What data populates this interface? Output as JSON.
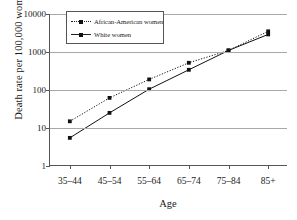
{
  "chart_data": {
    "type": "line",
    "title": "",
    "xlabel": "Age",
    "ylabel": "Death rate per 100,000 women",
    "categories": [
      "35–44",
      "45–54",
      "55–64",
      "65–74",
      "75–84",
      "85+"
    ],
    "yticks": [
      1,
      10,
      100,
      1000,
      10000
    ],
    "ytick_labels": [
      "1",
      "10",
      "100",
      "1000",
      "10000"
    ],
    "yscale": "log",
    "ylim": [
      1,
      10000
    ],
    "grid": "horizontal",
    "legend_position": "top-left-inside",
    "series": [
      {
        "name": "African-American women",
        "values": [
          15,
          62,
          190,
          520,
          1100,
          3500
        ],
        "line_style": "dotted",
        "marker": "square",
        "color": "#111111"
      },
      {
        "name": "White women",
        "values": [
          5.5,
          25,
          105,
          340,
          1100,
          2900
        ],
        "line_style": "solid",
        "marker": "square",
        "color": "#111111"
      }
    ]
  },
  "axis": {
    "x_title": "Age",
    "y_title": "Death rate per 100,000 women"
  },
  "legend": {
    "items": [
      {
        "label": "African-American women"
      },
      {
        "label": "White women"
      }
    ]
  }
}
